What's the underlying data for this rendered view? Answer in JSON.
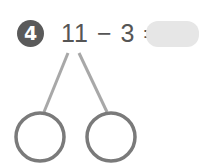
{
  "problem": {
    "number": "4",
    "expression": "11 − 3 =",
    "answer": ""
  },
  "colors": {
    "badge": "#5a5a5a",
    "text": "#555555",
    "answer_box": "#e6e6e6",
    "lines": "#a8a8a8",
    "circles": "#7a7a7a"
  },
  "number_bond": {
    "parts": [
      "",
      ""
    ]
  }
}
